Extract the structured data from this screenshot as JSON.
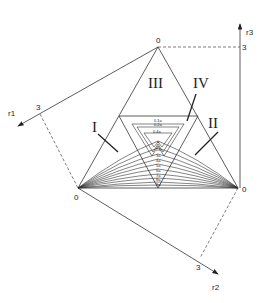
{
  "axes": {
    "r1": {
      "label": "r1",
      "tick": "3"
    },
    "r2": {
      "label": "r2",
      "tick": "3"
    },
    "r3": {
      "label": "r3",
      "tick": "3"
    }
  },
  "vertices": {
    "top": "0",
    "left": "0",
    "right": "0"
  },
  "regions": {
    "I": "I",
    "II": "II",
    "III": "III",
    "IV": "IV"
  },
  "contour_labels": {
    "upper": [
      "0.1a",
      "0.2a",
      "0.4a"
    ],
    "lower": [
      "a",
      "2a",
      "3a",
      "4a",
      "5a",
      "6a",
      "7a",
      "8a",
      "9a"
    ]
  },
  "colors": {
    "line": "#333333",
    "background": "#ffffff"
  }
}
